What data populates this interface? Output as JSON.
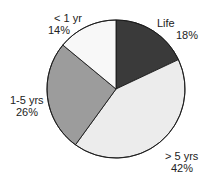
{
  "chart_data": {
    "type": "pie",
    "title": "",
    "categories": [
      "Life",
      "> 5 yrs",
      "1-5 yrs",
      "< 1 yr"
    ],
    "values": [
      18,
      42,
      26,
      14
    ],
    "units": "%",
    "colors": [
      "#3a3a3a",
      "#ececec",
      "#9c9c9c",
      "#f8f8f8"
    ],
    "start_angle_deg": 0,
    "direction": "clockwise",
    "legend": "none",
    "labels": [
      {
        "name": "Life",
        "value": "18%"
      },
      {
        "name": "> 5 yrs",
        "value": "42%"
      },
      {
        "name": "1-5 yrs",
        "value": "26%"
      },
      {
        "name": "< 1 yr",
        "value": "14%"
      }
    ]
  }
}
